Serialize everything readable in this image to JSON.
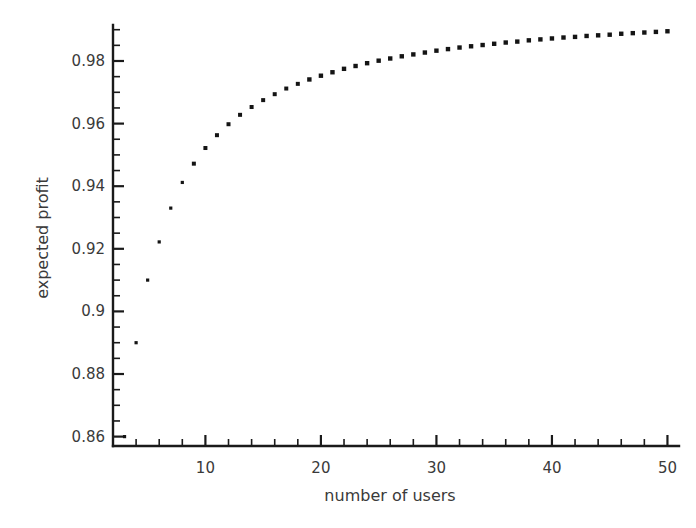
{
  "chart_data": {
    "type": "scatter",
    "title": "",
    "xlabel": "number of users",
    "ylabel": "expected profit",
    "xlim": [
      2,
      51
    ],
    "ylim": [
      0.857,
      0.9915
    ],
    "grid": false,
    "legend": null,
    "x_ticks_major": [
      10,
      20,
      30,
      40,
      50
    ],
    "x_tick_labels": [
      "10",
      "20",
      "30",
      "40",
      "50"
    ],
    "x_tick_minor_step": 2,
    "y_ticks_major": [
      0.86,
      0.88,
      0.9,
      0.92,
      0.94,
      0.96,
      0.98
    ],
    "y_tick_labels": [
      "0.86",
      "0.88",
      "0.9",
      "0.92",
      "0.94",
      "0.96",
      "0.98"
    ],
    "y_tick_minor_step": 0.005,
    "marker": "square",
    "marker_color": "#141414",
    "x": [
      3,
      4,
      5,
      6,
      7,
      8,
      9,
      10,
      11,
      12,
      13,
      14,
      15,
      16,
      17,
      18,
      19,
      20,
      21,
      22,
      23,
      24,
      25,
      26,
      27,
      28,
      29,
      30,
      31,
      32,
      33,
      34,
      35,
      36,
      37,
      38,
      39,
      40,
      41,
      42,
      43,
      44,
      45,
      46,
      47,
      48,
      49,
      50
    ],
    "y": [
      0.86,
      0.89,
      0.91,
      0.9222,
      0.933,
      0.9412,
      0.9472,
      0.9522,
      0.9563,
      0.9598,
      0.9628,
      0.9653,
      0.9675,
      0.9694,
      0.9712,
      0.9727,
      0.9741,
      0.9753,
      0.9764,
      0.9775,
      0.9784,
      0.9793,
      0.9801,
      0.9808,
      0.9815,
      0.9821,
      0.9827,
      0.9833,
      0.9838,
      0.9843,
      0.9847,
      0.9851,
      0.9855,
      0.9859,
      0.9862,
      0.9866,
      0.9869,
      0.9872,
      0.9875,
      0.9877,
      0.988,
      0.9882,
      0.9884,
      0.9887,
      0.9889,
      0.9891,
      0.9893,
      0.9895
    ]
  },
  "labels": {
    "x_axis_title": "number of users",
    "y_axis_title": "expected profit"
  }
}
